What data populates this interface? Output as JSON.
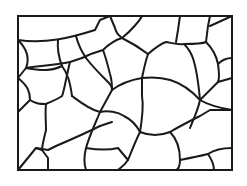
{
  "diagram": {
    "type": "grain-boundary-structure",
    "frame": {
      "x": 18,
      "y": 16,
      "width": 214,
      "height": 154
    },
    "colors": {
      "background": "#ffffff",
      "line": "#1a1a1a"
    },
    "boundaries": [
      "M18,40 C45,44 70,38 95,30 L100,20 L110,16",
      "M110,16 L115,28 C116,33 118,35 122,38",
      "M18,40 C26,48 30,58 26,68 L18,78",
      "M26,68 C40,66 55,65 70,62 L82,58",
      "M58,40 C57,50 59,58 62,66",
      "M76,36 C78,44 82,52 86,58",
      "M82,58 C88,55 96,52 103,50",
      "M103,50 C108,45 115,40 122,38",
      "M122,38 C132,30 140,20 142,16",
      "M122,38 C130,42 140,48 148,54",
      "M86,58 C92,66 100,74 106,80 C110,84 112,86 112,90",
      "M103,50 C106,58 108,66 110,74 C112,80 112,86 112,90",
      "M148,54 C146,60 144,68 142,78",
      "M142,78 C130,80 120,84 112,90",
      "M148,54 C155,48 160,44 166,42 C172,43 178,45 184,44",
      "M180,16 L178,30 L176,42",
      "M210,16 L208,26 L206,42 C202,44 196,44 184,44",
      "M210,26 L232,16",
      "M206,42 C212,48 216,54 218,64",
      "M218,64 C222,60 228,58 232,58",
      "M218,64 C219,72 220,78 218,82 L232,78",
      "M218,82 C210,90 204,96 200,100",
      "M184,44 C190,50 196,56 200,100",
      "M142,78 C160,76 180,78 200,100",
      "M200,100 C210,106 220,108 232,110",
      "M18,78 C28,86 30,92 30,100 L18,112",
      "M30,100 C36,104 40,104 46,104",
      "M46,104 C45,112 46,122 46,130 C44,138 42,146 42,150",
      "M26,68 C40,70 50,72 62,66",
      "M62,66 C68,74 70,82 72,96",
      "M72,96 C80,102 90,110 100,112 L112,90",
      "M70,62 C66,78 64,92 62,96 C56,100 50,102 46,104",
      "M100,112 C96,122 90,134 86,148 C84,156 84,164 86,170",
      "M100,112 C108,110 118,112 124,116 C132,120 136,124 140,132",
      "M140,132 C136,140 132,150 128,160 C124,166 120,168 118,170",
      "M18,170 L36,148 L42,150",
      "M36,148 L48,150 L56,146",
      "M42,150 L48,158 L48,170",
      "M56,146 C70,140 84,134 100,126",
      "M100,126 L112,122",
      "M140,132 C150,136 160,136 170,132",
      "M170,132 C176,138 180,146 180,160 C180,166 178,170 176,170",
      "M170,132 C180,126 192,120 200,116 L210,110 L232,110",
      "M140,132 C142,120 144,108 142,96 L142,78",
      "M180,160 C190,158 200,156 208,154",
      "M208,154 C214,150 222,148 232,148",
      "M208,154 C212,160 214,166 214,170",
      "M86,148 C98,150 110,150 118,148 L128,160",
      "M200,100 C198,110 194,118 190,128"
    ]
  }
}
